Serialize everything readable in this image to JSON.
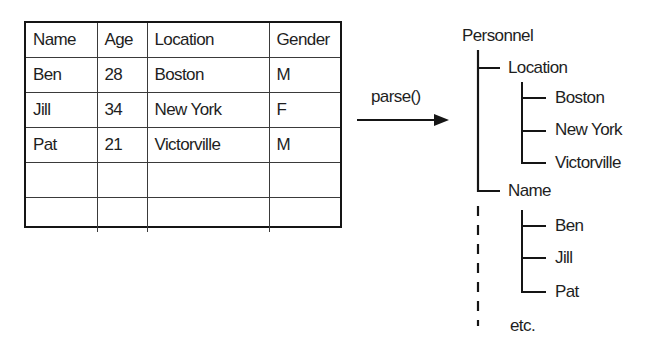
{
  "table": {
    "headers": [
      "Name",
      "Age",
      "Location",
      "Gender"
    ],
    "rows": [
      [
        "Ben",
        "28",
        "Boston",
        "M"
      ],
      [
        "Jill",
        "34",
        "New York",
        "F"
      ],
      [
        "Pat",
        "21",
        "Victorville",
        "M"
      ],
      [
        "",
        "",
        "",
        ""
      ],
      [
        "",
        "",
        "",
        ""
      ]
    ]
  },
  "arrow": {
    "label": "parse()"
  },
  "tree": {
    "root": "Personnel",
    "groups": [
      {
        "label": "Location",
        "children": [
          "Boston",
          "New York",
          "Victorville"
        ]
      },
      {
        "label": "Name",
        "children": [
          "Ben",
          "Jill",
          "Pat"
        ]
      }
    ],
    "continuation": "etc."
  }
}
